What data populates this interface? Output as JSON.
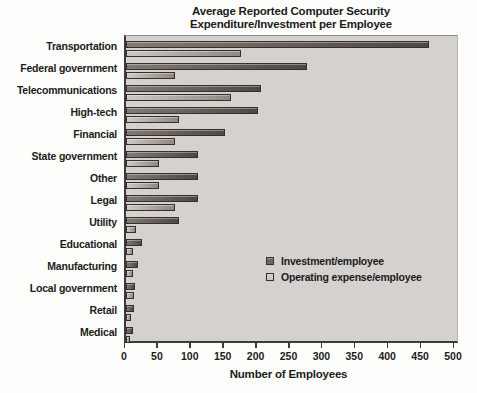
{
  "title": {
    "line1": "Average Reported Computer Security",
    "line2": "Expenditure/Investment per Employee"
  },
  "chart_data": {
    "type": "bar",
    "orientation": "horizontal",
    "title": "Average Reported Computer Security Expenditure/Investment per Employee",
    "xlabel": "Number of Employees",
    "ylabel": "",
    "xlim": [
      0,
      500
    ],
    "x_ticks": [
      0,
      50,
      100,
      150,
      200,
      250,
      300,
      350,
      400,
      450,
      500
    ],
    "grid": false,
    "legend_position": "inside-right",
    "categories": [
      "Transportation",
      "Federal government",
      "Telecommunications",
      "High-tech",
      "Financial",
      "State government",
      "Other",
      "Legal",
      "Utility",
      "Educational",
      "Manufacturing",
      "Local government",
      "Retail",
      "Medical"
    ],
    "series": [
      {
        "name": "Investment/employee",
        "values": [
          460,
          275,
          205,
          200,
          150,
          110,
          110,
          110,
          80,
          25,
          18,
          14,
          12,
          11
        ]
      },
      {
        "name": "Operating expense/employee",
        "values": [
          175,
          75,
          160,
          80,
          75,
          50,
          50,
          75,
          15,
          10,
          10,
          12,
          8,
          6
        ]
      }
    ]
  },
  "colors": {
    "investment_dark": "#4e4742",
    "investment_mid": "#6f6762",
    "investment_light": "#837a74",
    "operating_dark": "#8f8780",
    "operating_light": "#cfc9c4",
    "plot_bg": "#d4d1ce",
    "bar_border": "#35302c",
    "axis": "#3d3a38",
    "text": "#1c1b1a"
  }
}
